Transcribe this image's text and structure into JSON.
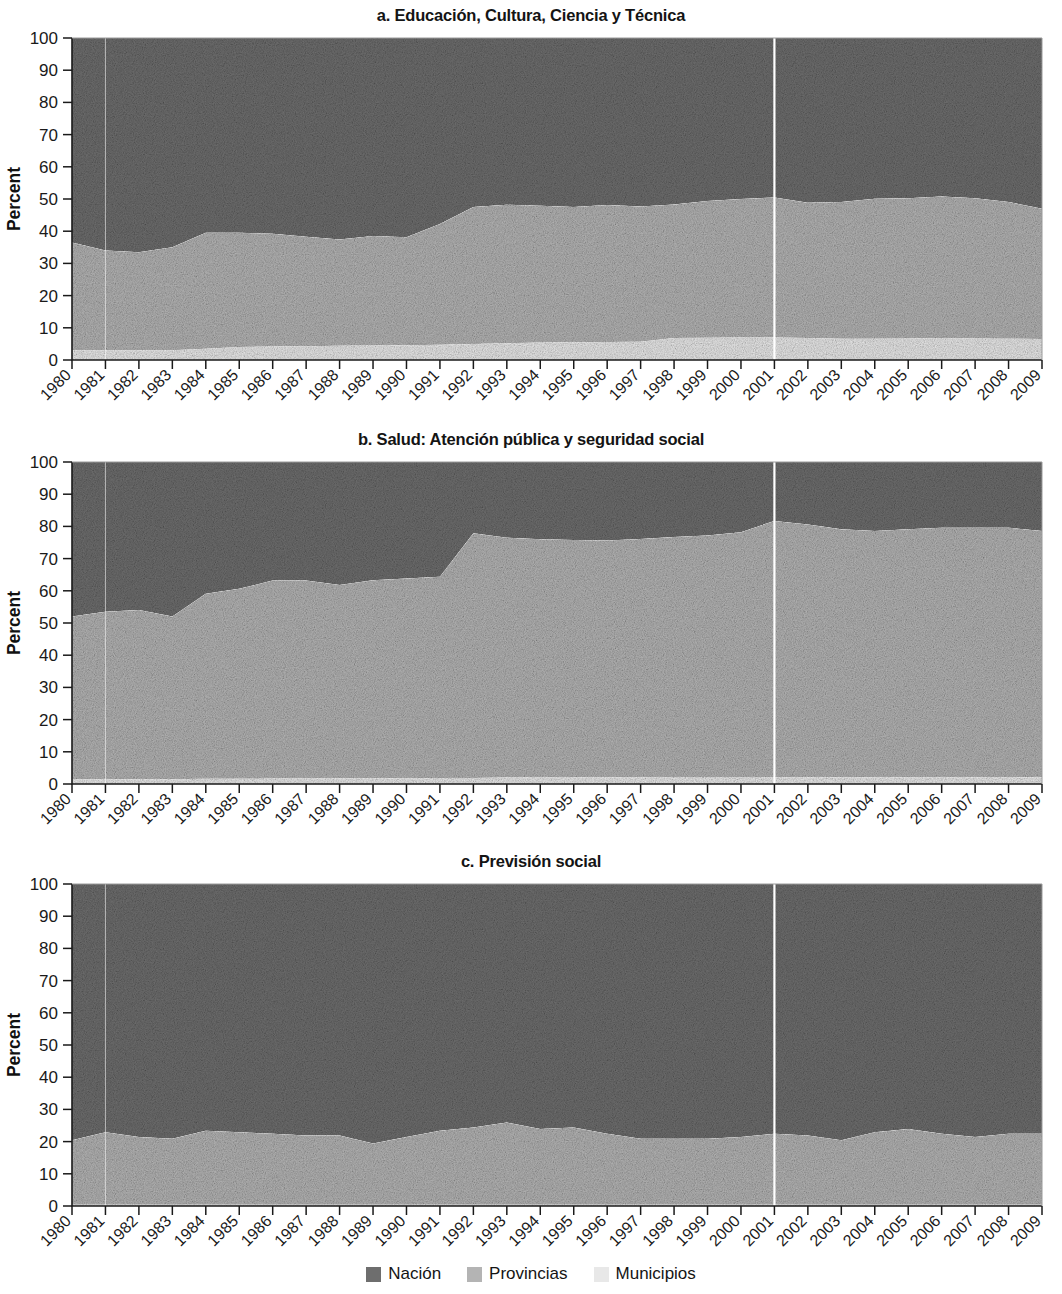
{
  "figure": {
    "y_axis_title": "Percent",
    "y_ticks": [
      0,
      10,
      20,
      30,
      40,
      50,
      60,
      70,
      80,
      90,
      100
    ],
    "years": [
      1980,
      1981,
      1982,
      1983,
      1984,
      1985,
      1986,
      1987,
      1988,
      1989,
      1990,
      1991,
      1992,
      1993,
      1994,
      1995,
      1996,
      1997,
      1998,
      1999,
      2000,
      2001,
      2002,
      2003,
      2004,
      2005,
      2006,
      2007,
      2008,
      2009
    ],
    "marker_year": 2001,
    "colors": {
      "nacion": "#6e6e6e",
      "provincias": "#b4b4b4",
      "municipios": "#e8e8e8",
      "axis": "#1a1a1a",
      "background": "#ffffff",
      "marker_line": "#ffffff"
    }
  },
  "legend": {
    "items": [
      {
        "label": "Nación",
        "color": "#6e6e6e",
        "key": "nacion"
      },
      {
        "label": "Provincias",
        "color": "#b4b4b4",
        "key": "provincias"
      },
      {
        "label": "Municipios",
        "color": "#e8e8e8",
        "key": "municipios"
      }
    ]
  },
  "chart_data": [
    {
      "id": "panel-a",
      "type": "area",
      "stacked": true,
      "title": "a. Educación, Cultura, Ciencia y Técnica",
      "xlabel": "",
      "ylabel": "Percent",
      "ylim": [
        0,
        100
      ],
      "grid": false,
      "legend_position": "bottom",
      "categories": [
        1980,
        1981,
        1982,
        1983,
        1984,
        1985,
        1986,
        1987,
        1988,
        1989,
        1990,
        1991,
        1992,
        1993,
        1994,
        1995,
        1996,
        1997,
        1998,
        1999,
        2000,
        2001,
        2002,
        2003,
        2004,
        2005,
        2006,
        2007,
        2008,
        2009
      ],
      "series": [
        {
          "name": "Municipios",
          "color": "#e8e8e8",
          "values": [
            3.0,
            3.0,
            3.0,
            3.0,
            3.5,
            4.0,
            4.2,
            4.3,
            4.4,
            4.5,
            4.6,
            4.7,
            5.0,
            5.2,
            5.4,
            5.5,
            5.6,
            5.7,
            6.8,
            6.9,
            7.0,
            7.0,
            6.8,
            6.6,
            6.6,
            6.7,
            6.8,
            6.7,
            6.6,
            6.5
          ]
        },
        {
          "name": "Provincias",
          "color": "#b4b4b4",
          "values": [
            33.5,
            31.0,
            30.5,
            32.0,
            36.0,
            35.5,
            35.0,
            34.0,
            33.0,
            34.0,
            33.5,
            37.5,
            42.5,
            43.0,
            42.5,
            42.0,
            42.5,
            42.0,
            41.5,
            42.5,
            43.0,
            43.5,
            42.0,
            42.5,
            43.5,
            43.5,
            44.0,
            43.5,
            42.5,
            40.5
          ]
        },
        {
          "name": "Nación",
          "color": "#6e6e6e",
          "values": [
            63.5,
            66.0,
            66.5,
            65.0,
            60.5,
            60.5,
            60.8,
            61.7,
            62.6,
            61.5,
            61.9,
            57.8,
            52.5,
            51.8,
            52.1,
            52.5,
            51.9,
            52.3,
            51.7,
            50.6,
            50.0,
            49.5,
            51.2,
            50.9,
            49.9,
            49.8,
            49.2,
            49.8,
            50.9,
            53.0
          ]
        }
      ]
    },
    {
      "id": "panel-b",
      "type": "area",
      "stacked": true,
      "title": "b. Salud: Atención pública y seguridad social",
      "xlabel": "",
      "ylabel": "Percent",
      "ylim": [
        0,
        100
      ],
      "grid": false,
      "legend_position": "bottom",
      "categories": [
        1980,
        1981,
        1982,
        1983,
        1984,
        1985,
        1986,
        1987,
        1988,
        1989,
        1990,
        1991,
        1992,
        1993,
        1994,
        1995,
        1996,
        1997,
        1998,
        1999,
        2000,
        2001,
        2002,
        2003,
        2004,
        2005,
        2006,
        2007,
        2008,
        2009
      ],
      "series": [
        {
          "name": "Municipios",
          "color": "#e8e8e8",
          "values": [
            1.5,
            1.5,
            1.5,
            1.5,
            1.6,
            1.6,
            1.7,
            1.7,
            1.8,
            1.8,
            1.8,
            1.9,
            1.9,
            2.0,
            2.0,
            2.0,
            2.1,
            2.1,
            2.2,
            2.2,
            2.2,
            2.2,
            2.1,
            2.1,
            2.1,
            2.1,
            2.1,
            2.1,
            2.1,
            2.1
          ]
        },
        {
          "name": "Provincias",
          "color": "#b4b4b4",
          "values": [
            50.5,
            52.0,
            52.5,
            50.5,
            57.5,
            59.0,
            61.5,
            61.5,
            60.0,
            61.5,
            62.0,
            62.5,
            76.0,
            74.5,
            74.0,
            73.8,
            73.5,
            74.0,
            74.5,
            75.0,
            76.0,
            79.5,
            78.5,
            77.0,
            76.5,
            77.0,
            77.5,
            77.5,
            77.5,
            76.5
          ]
        },
        {
          "name": "Nación",
          "color": "#6e6e6e",
          "values": [
            48.0,
            46.5,
            46.0,
            48.0,
            40.9,
            39.4,
            36.8,
            36.8,
            38.2,
            36.7,
            36.2,
            35.6,
            22.1,
            23.5,
            24.0,
            24.2,
            24.4,
            23.9,
            23.3,
            22.8,
            21.8,
            18.3,
            19.4,
            20.9,
            21.4,
            20.9,
            20.4,
            20.4,
            20.4,
            21.4
          ]
        }
      ]
    },
    {
      "id": "panel-c",
      "type": "area",
      "stacked": true,
      "title": "c. Previsión social",
      "xlabel": "",
      "ylabel": "Percent",
      "ylim": [
        0,
        100
      ],
      "grid": false,
      "legend_position": "bottom",
      "categories": [
        1980,
        1981,
        1982,
        1983,
        1984,
        1985,
        1986,
        1987,
        1988,
        1989,
        1990,
        1991,
        1992,
        1993,
        1994,
        1995,
        1996,
        1997,
        1998,
        1999,
        2000,
        2001,
        2002,
        2003,
        2004,
        2005,
        2006,
        2007,
        2008,
        2009
      ],
      "series": [
        {
          "name": "Municipios",
          "color": "#e8e8e8",
          "values": [
            0.4,
            0.4,
            0.4,
            0.4,
            0.4,
            0.4,
            0.4,
            0.4,
            0.4,
            0.4,
            0.4,
            0.4,
            0.4,
            0.4,
            0.4,
            0.4,
            0.4,
            0.4,
            0.4,
            0.4,
            0.4,
            0.4,
            0.4,
            0.4,
            0.4,
            0.4,
            0.4,
            0.4,
            0.4,
            0.4
          ]
        },
        {
          "name": "Provincias",
          "color": "#b4b4b4",
          "values": [
            20.0,
            22.5,
            21.0,
            20.5,
            23.0,
            22.5,
            22.0,
            21.5,
            21.5,
            19.0,
            21.0,
            23.0,
            24.0,
            25.5,
            23.5,
            24.0,
            22.0,
            20.5,
            20.5,
            20.5,
            21.0,
            22.0,
            21.5,
            20.0,
            22.5,
            23.5,
            22.0,
            21.0,
            22.0,
            22.0
          ]
        },
        {
          "name": "Nación",
          "color": "#6e6e6e",
          "values": [
            79.6,
            77.1,
            78.6,
            79.1,
            76.6,
            77.1,
            77.6,
            78.1,
            78.1,
            80.6,
            78.6,
            76.6,
            75.6,
            74.1,
            76.1,
            75.6,
            77.6,
            79.1,
            79.1,
            79.1,
            78.6,
            77.6,
            78.1,
            79.6,
            77.1,
            76.1,
            77.6,
            78.6,
            77.6,
            77.6
          ]
        }
      ]
    }
  ]
}
